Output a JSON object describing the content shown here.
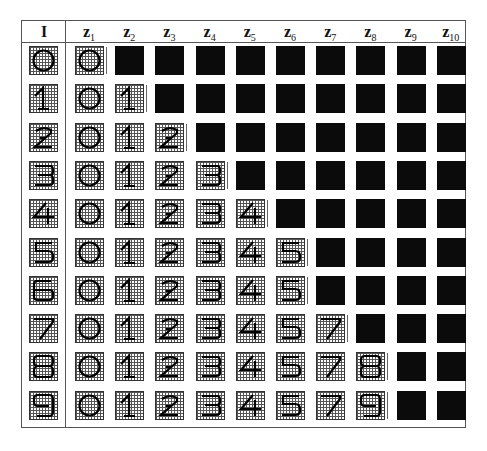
{
  "table": {
    "input_header": "I",
    "column_headers": [
      {
        "base": "z",
        "sub": "1"
      },
      {
        "base": "z",
        "sub": "2"
      },
      {
        "base": "z",
        "sub": "3"
      },
      {
        "base": "z",
        "sub": "4"
      },
      {
        "base": "z",
        "sub": "5"
      },
      {
        "base": "z",
        "sub": "6"
      },
      {
        "base": "z",
        "sub": "7"
      },
      {
        "base": "z",
        "sub": "8"
      },
      {
        "base": "z",
        "sub": "9"
      },
      {
        "base": "z",
        "sub": "10"
      }
    ],
    "rows": [
      {
        "input": "0",
        "outputs": [
          "0",
          "B",
          "B",
          "B",
          "B",
          "B",
          "B",
          "B",
          "B",
          "B"
        ]
      },
      {
        "input": "1",
        "outputs": [
          "0",
          "1",
          "B",
          "B",
          "B",
          "B",
          "B",
          "B",
          "B",
          "B"
        ]
      },
      {
        "input": "2",
        "outputs": [
          "0",
          "1",
          "2",
          "B",
          "B",
          "B",
          "B",
          "B",
          "B",
          "B"
        ]
      },
      {
        "input": "3",
        "outputs": [
          "0",
          "1",
          "2",
          "3",
          "B",
          "B",
          "B",
          "B",
          "B",
          "B"
        ]
      },
      {
        "input": "4",
        "outputs": [
          "0",
          "1",
          "2",
          "3",
          "4",
          "B",
          "B",
          "B",
          "B",
          "B"
        ]
      },
      {
        "input": "5",
        "outputs": [
          "0",
          "1",
          "2",
          "3",
          "4",
          "5",
          "B",
          "B",
          "B",
          "B"
        ]
      },
      {
        "input": "6",
        "outputs": [
          "0",
          "1",
          "2",
          "3",
          "4",
          "5",
          "B",
          "B",
          "B",
          "B"
        ]
      },
      {
        "input": "7",
        "outputs": [
          "0",
          "1",
          "2",
          "3",
          "4",
          "5",
          "7",
          "B",
          "B",
          "B"
        ]
      },
      {
        "input": "8",
        "outputs": [
          "0",
          "1",
          "2",
          "3",
          "4",
          "5",
          "7",
          "8",
          "B",
          "B"
        ]
      },
      {
        "input": "9",
        "outputs": [
          "0",
          "1",
          "2",
          "3",
          "4",
          "5",
          "7",
          "9",
          "B",
          "B"
        ]
      }
    ],
    "legend": {
      "B": "black (empty/unset) cell"
    },
    "colors": {
      "black_cell": "#0b0b0b",
      "grid_line": "#555555",
      "stroke": "#000000"
    }
  }
}
